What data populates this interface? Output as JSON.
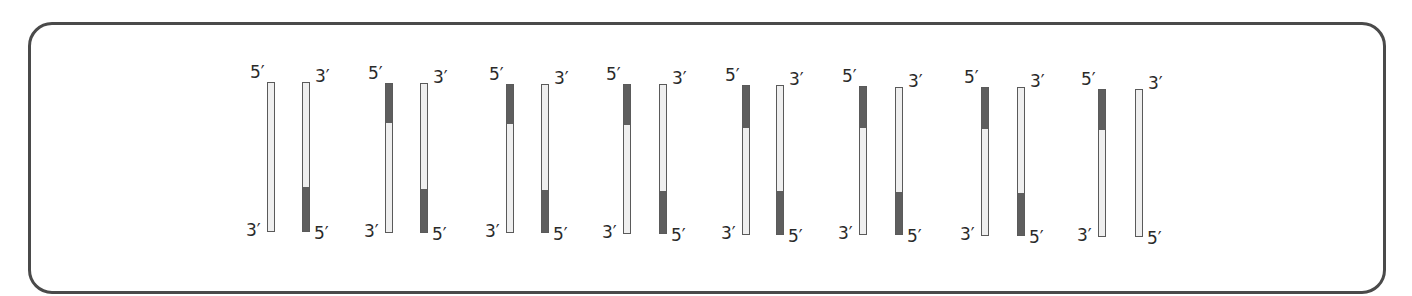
{
  "diagram": {
    "colors": {
      "frame": "#4a4a4a",
      "strand_fill": "#efefef",
      "strand_border": "#5a5a5a",
      "dark_segment": "#5e5e5e"
    },
    "labels": {
      "five_prime": "5′",
      "three_prime": "3′"
    },
    "pairs": [
      {
        "left": {
          "x": 267,
          "top": 82,
          "bottom": 232,
          "dark_top_end": null
        },
        "right": {
          "x": 302,
          "top": 82,
          "bottom": 232,
          "dark_bottom_start": 188
        }
      },
      {
        "left": {
          "x": 385,
          "top": 83,
          "bottom": 233,
          "dark_top_end": 122
        },
        "right": {
          "x": 420,
          "top": 83,
          "bottom": 233,
          "dark_bottom_start": 190
        }
      },
      {
        "left": {
          "x": 506,
          "top": 84,
          "bottom": 233,
          "dark_top_end": 123
        },
        "right": {
          "x": 541,
          "top": 84,
          "bottom": 233,
          "dark_bottom_start": 191
        }
      },
      {
        "left": {
          "x": 623,
          "top": 84,
          "bottom": 234,
          "dark_top_end": 124
        },
        "right": {
          "x": 659,
          "top": 84,
          "bottom": 234,
          "dark_bottom_start": 192
        }
      },
      {
        "left": {
          "x": 742,
          "top": 85,
          "bottom": 235,
          "dark_top_end": 127
        },
        "right": {
          "x": 776,
          "top": 85,
          "bottom": 235,
          "dark_bottom_start": 192
        }
      },
      {
        "left": {
          "x": 859,
          "top": 86,
          "bottom": 235,
          "dark_top_end": 127
        },
        "right": {
          "x": 895,
          "top": 87,
          "bottom": 235,
          "dark_bottom_start": 193
        }
      },
      {
        "left": {
          "x": 981,
          "top": 87,
          "bottom": 236,
          "dark_top_end": 128
        },
        "right": {
          "x": 1017,
          "top": 87,
          "bottom": 236,
          "dark_bottom_start": 194
        }
      },
      {
        "left": {
          "x": 1098,
          "top": 89,
          "bottom": 237,
          "dark_top_end": 129
        },
        "right": {
          "x": 1135,
          "top": 89,
          "bottom": 237,
          "dark_bottom_start": null
        }
      }
    ]
  }
}
